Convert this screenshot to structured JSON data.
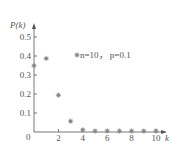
{
  "chart_data": {
    "type": "scatter",
    "title": "",
    "xlabel": "k",
    "ylabel": "P(k)",
    "legend": "n=10， p=0.1",
    "x": [
      0,
      1,
      2,
      3,
      4,
      5,
      6,
      7,
      8,
      9,
      10
    ],
    "values": [
      0.349,
      0.387,
      0.194,
      0.057,
      0.011,
      0.0015,
      0.0001,
      0,
      0,
      0,
      0
    ],
    "xlim": [
      0,
      10.5
    ],
    "ylim": [
      0,
      0.55
    ],
    "x_ticks": [
      "2",
      "4",
      "6",
      "8",
      "10"
    ],
    "y_ticks": [
      "0.1",
      "0.2",
      "0.3",
      "0.4",
      "0.5"
    ],
    "origin_label": "0",
    "marker": "asterisk",
    "marker_color": "#888888",
    "grid": false
  }
}
